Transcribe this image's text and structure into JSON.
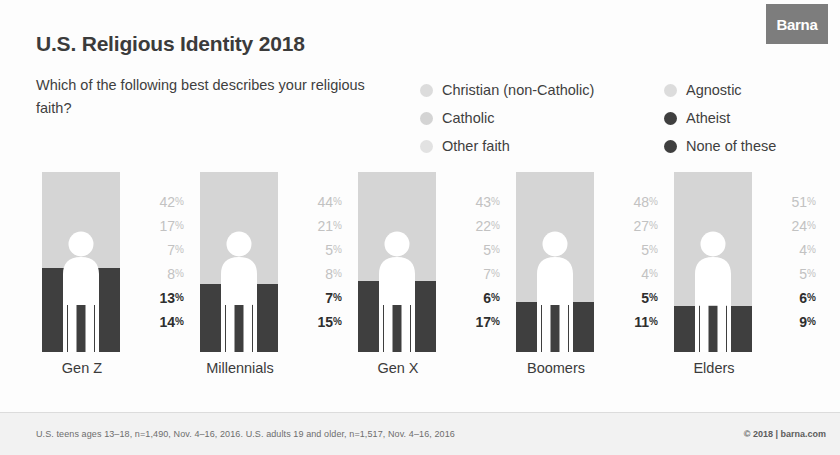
{
  "brand": {
    "logo_text": "Barna"
  },
  "header": {
    "title": "U.S. Religious Identity 2018",
    "subtitle": "Which of the following best describes your religious faith?"
  },
  "legend": {
    "items": [
      {
        "label": "Christian (non-Catholic)",
        "color": "#dcdcdc",
        "column": "left"
      },
      {
        "label": "Agnostic",
        "color": "#dcdcdc",
        "column": "right"
      },
      {
        "label": "Catholic",
        "color": "#d4d4d4",
        "column": "left"
      },
      {
        "label": "Atheist",
        "color": "#3f3f3f",
        "column": "right"
      },
      {
        "label": "Other faith",
        "color": "#e2e2e2",
        "column": "left"
      },
      {
        "label": "None of these",
        "color": "#3f3f3f",
        "column": "right"
      }
    ]
  },
  "footer": {
    "note": "U.S. teens ages 13–18, n=1,490, Nov. 4–16, 2016. U.S. adults 19 and older, n=1,517, Nov. 4–16, 2016",
    "copyright": "© 2018 | barna.com"
  },
  "chart_data": {
    "type": "bar",
    "title": "U.S. Religious Identity 2018",
    "subtitle": "Which of the following best describes your religious faith?",
    "xlabel": "",
    "ylabel": "",
    "ylim": [
      0,
      100
    ],
    "grid": false,
    "legend_position": "top-right",
    "stacked": true,
    "units": "percent",
    "categories": [
      "Gen Z",
      "Millennials",
      "Gen X",
      "Boomers",
      "Elders"
    ],
    "series": [
      {
        "name": "Christian (non-Catholic)",
        "color": "#dcdcdc",
        "values": [
          42,
          44,
          43,
          48,
          51
        ]
      },
      {
        "name": "Catholic",
        "color": "#d4d4d4",
        "values": [
          17,
          21,
          22,
          27,
          24
        ]
      },
      {
        "name": "Other faith",
        "color": "#e2e2e2",
        "values": [
          7,
          5,
          5,
          5,
          4
        ]
      },
      {
        "name": "Agnostic",
        "color": "#dcdcdc",
        "values": [
          8,
          8,
          7,
          4,
          5
        ]
      },
      {
        "name": "Atheist",
        "color": "#3f3f3f",
        "values": [
          13,
          7,
          6,
          5,
          6
        ]
      },
      {
        "name": "None of these",
        "color": "#3f3f3f",
        "values": [
          14,
          15,
          17,
          11,
          9
        ]
      }
    ]
  },
  "columns": [
    {
      "label": "Gen Z",
      "values": [
        "42",
        "17",
        "7",
        "8",
        "13",
        "14"
      ],
      "suffix": "%",
      "dark_total": 27
    },
    {
      "label": "Millennials",
      "values": [
        "44",
        "21",
        "5",
        "8",
        "7",
        "15"
      ],
      "suffix": "%",
      "dark_total": 22
    },
    {
      "label": "Gen X",
      "values": [
        "43",
        "22",
        "5",
        "7",
        "6",
        "17"
      ],
      "suffix": "%",
      "dark_total": 23
    },
    {
      "label": "Boomers",
      "values": [
        "48",
        "27",
        "5",
        "4",
        "5",
        "11"
      ],
      "suffix": "%",
      "dark_total": 16
    },
    {
      "label": "Elders",
      "values": [
        "51",
        "24",
        "4",
        "5",
        "6",
        "9"
      ],
      "suffix": "%",
      "dark_total": 15
    }
  ]
}
